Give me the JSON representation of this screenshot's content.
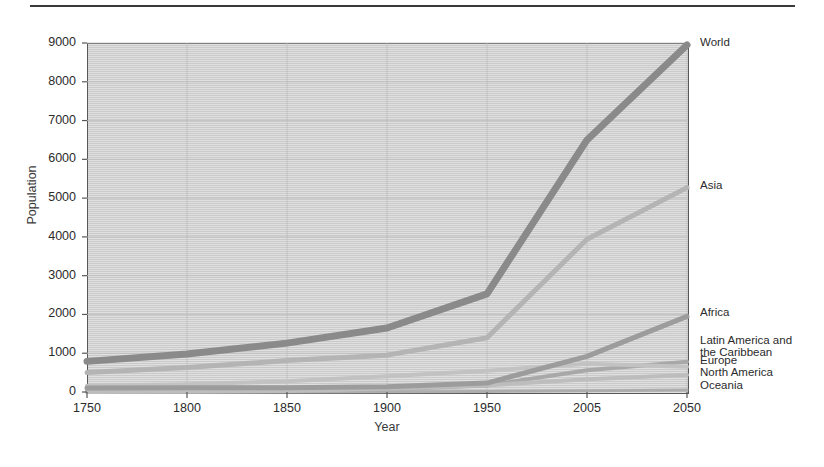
{
  "figure": {
    "has_top_rule": true,
    "background_color": "#ffffff",
    "plot_background_color": "#d2d2d2",
    "axis_color": "#585858",
    "text_color": "#2b2b2b"
  },
  "axes": {
    "y_title": "Population",
    "x_title": "Year",
    "y_ticks": [
      "0",
      "1000",
      "2000",
      "3000",
      "4000",
      "5000",
      "6000",
      "7000",
      "8000",
      "9000"
    ],
    "x_ticks": [
      "1750",
      "1800",
      "1850",
      "1900",
      "1950",
      "2005",
      "2050"
    ]
  },
  "chart_data": {
    "type": "line",
    "title": "",
    "xlabel": "Year",
    "ylabel": "Population",
    "x": [
      "1750",
      "1800",
      "1850",
      "1900",
      "1950",
      "2005",
      "2050"
    ],
    "x_spacing": "even",
    "ylim": [
      0,
      9000
    ],
    "y_tick_step": 1000,
    "grid": true,
    "legend_position": "right-inline",
    "series": [
      {
        "name": "World",
        "values": [
          790,
          980,
          1260,
          1650,
          2530,
          6500,
          8950
        ],
        "color": "#8a8a8a",
        "width": 7,
        "label_y": 43
      },
      {
        "name": "Asia",
        "values": [
          500,
          630,
          810,
          950,
          1400,
          3940,
          5270
        ],
        "color": "#b4b4b4",
        "width": 5,
        "label_y": 186
      },
      {
        "name": "Africa",
        "values": [
          106,
          107,
          111,
          133,
          230,
          920,
          1950
        ],
        "color": "#9c9c9c",
        "width": 5,
        "label_y": 313
      },
      {
        "name": "Latin America and the Caribbean",
        "values": [
          16,
          24,
          38,
          74,
          167,
          560,
          780
        ],
        "color": "#a8a8a8",
        "width": 4,
        "label_y": 341,
        "label_line2": "the Caribbean"
      },
      {
        "name": "Europe",
        "values": [
          163,
          203,
          276,
          408,
          547,
          728,
          650
        ],
        "color": "#c2c2c2",
        "width": 4,
        "label_y": 361
      },
      {
        "name": "North America",
        "values": [
          2,
          7,
          26,
          82,
          172,
          330,
          440
        ],
        "color": "#bdbdbd",
        "width": 4,
        "label_y": 373
      },
      {
        "name": "Oceania",
        "values": [
          2,
          2,
          2,
          6,
          13,
          33,
          50
        ],
        "color": "#adadad",
        "width": 3,
        "label_y": 386
      }
    ]
  }
}
